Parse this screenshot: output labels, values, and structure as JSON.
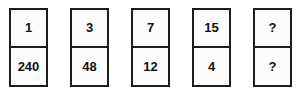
{
  "puzzle": {
    "type": "number-sequence-cards",
    "background_color": "#ffffff",
    "border_color": "#1d1d1d",
    "text_color": "#121212",
    "unknown_symbol": "?",
    "cards": [
      {
        "top": "1",
        "bottom": "240"
      },
      {
        "top": "3",
        "bottom": "48"
      },
      {
        "top": "7",
        "bottom": "12"
      },
      {
        "top": "15",
        "bottom": "4"
      },
      {
        "top": "?",
        "bottom": "?"
      }
    ]
  }
}
